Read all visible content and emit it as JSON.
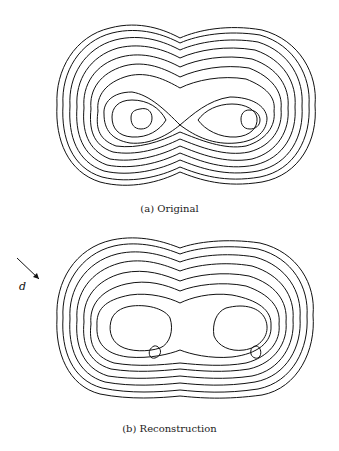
{
  "figure": {
    "panels": [
      {
        "id": "a",
        "caption": "(a) Original",
        "description": "contour plot of two-lobed density, lobes connected by X-shaped saddle"
      },
      {
        "id": "b",
        "caption": "(b) Reconstruction",
        "description": "reconstructed contour plot of two-lobed density with separated lobe centers"
      }
    ],
    "direction_label": "d",
    "direction_arrow": "arrow-pointing-down-right"
  }
}
